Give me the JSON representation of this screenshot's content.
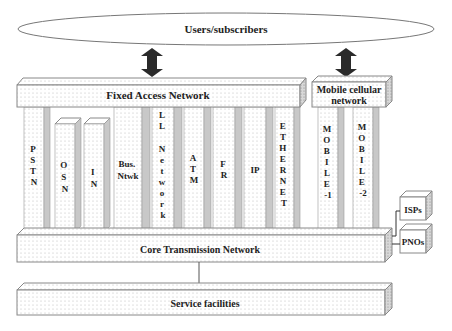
{
  "diagram": {
    "top": {
      "label": "Users/subscribers"
    },
    "access": {
      "fixed_label": "Fixed Access Network",
      "mobile_label_line1": "Mobile cellular",
      "mobile_label_line2": "network"
    },
    "columns": [
      {
        "id": "pstn",
        "letters": [
          "P",
          "S",
          "T",
          "N"
        ]
      },
      {
        "id": "osn",
        "letters": [
          "O",
          "S",
          "N"
        ]
      },
      {
        "id": "in",
        "letters": [
          "I",
          "N"
        ]
      },
      {
        "id": "bus-ntwk",
        "lines": [
          "Bus.",
          "Ntwk"
        ]
      },
      {
        "id": "ll-network",
        "letters": [
          "L",
          "L",
          "",
          "N",
          "e",
          "t",
          "w",
          "o",
          "r",
          "k"
        ]
      },
      {
        "id": "atm",
        "letters": [
          "A",
          "T",
          "M"
        ]
      },
      {
        "id": "fr",
        "letters": [
          "F",
          "R"
        ]
      },
      {
        "id": "ip",
        "lines": [
          "IP"
        ]
      },
      {
        "id": "ethernet",
        "letters": [
          "E",
          "T",
          "H",
          "E",
          "R",
          "N",
          "E",
          "T"
        ]
      },
      {
        "id": "mobile-1",
        "letters": [
          "M",
          "O",
          "B",
          "I",
          "L",
          "E",
          "-1"
        ]
      },
      {
        "id": "mobile-2",
        "letters": [
          "M",
          "O",
          "B",
          "I",
          "L",
          "E",
          "-2"
        ]
      }
    ],
    "core": {
      "label": "Core Transmission Network"
    },
    "external": {
      "isps": "ISPs",
      "pnos": "PNOs"
    },
    "bottom": {
      "label": "Service facilities"
    },
    "colors": {
      "stroke": "#888888",
      "shade": "#c8c8c8",
      "arrow": "#2a2a2a",
      "dot": "#b0b0b0"
    }
  }
}
